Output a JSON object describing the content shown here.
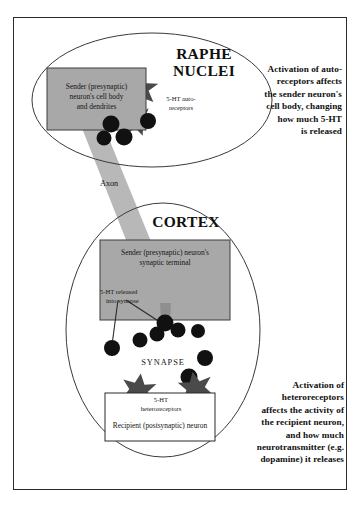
{
  "figure": {
    "regions": {
      "raphe": {
        "name": "RAPHE NUCLEI",
        "line1": "RAPHE",
        "line2": "NUCLEI",
        "sender_box_line1": "Sender (presynaptic)",
        "sender_box_line2": "neuron's cell body",
        "sender_box_line3": "and dendrites",
        "autoreceptor_line1": "5-HT auto-",
        "autoreceptor_line2": "receptors"
      },
      "axon": {
        "label": "Axon"
      },
      "cortex": {
        "name": "CORTEX",
        "terminal_line1": "Sender (presynaptic) neuron's",
        "terminal_line2": "synaptic terminal",
        "release_line1": "5-HT released",
        "release_line2": "into synapse",
        "synapse_label": "SYNAPSE",
        "heteroreceptor_line1": "5-HT",
        "heteroreceptor_line2": "heteroreceptors",
        "recipient_label": "Recipient (postsynaptic) neuron"
      }
    },
    "annotations": {
      "top_right": {
        "lines": [
          "Activation of auto-",
          "receptors affects",
          "the sender neuron's",
          "cell body, changing",
          "how much 5-HT",
          "is released"
        ]
      },
      "bottom_right": {
        "lines": [
          "Activation of",
          "heteroreceptors",
          "affects the activity of",
          "the recipient neuron,",
          "and how much",
          "neurotransmitter (e.g.",
          "dopamine) it releases"
        ]
      }
    },
    "colors": {
      "frame_stroke": "#2b2b2b",
      "oval_stroke": "#3a3a3a",
      "cell_fill": "#a8a8a8",
      "cell_stroke": "#3c3c3c",
      "axon_fill": "#b8b8b8",
      "receptor_fill": "#4a4a4a",
      "molecule_fill": "#111111",
      "background": "#ffffff",
      "text": "#101010"
    },
    "shapes": {
      "raphe_oval": {
        "cx": 152,
        "cy": 100,
        "rx": 120,
        "ry": 67
      },
      "cortex_oval": {
        "cx": 163,
        "cy": 330,
        "rx": 97,
        "ry": 127
      },
      "sender_cell_box": {
        "x": 47,
        "y": 68,
        "w": 99,
        "h": 62
      },
      "terminal_box": {
        "x": 100,
        "y": 240,
        "w": 130,
        "h": 80
      },
      "recipient_box": {
        "x": 105,
        "y": 393,
        "w": 110,
        "h": 48
      },
      "autoreceptors": [
        {
          "cx": 140,
          "cy": 88,
          "r": 18,
          "rot": 12
        },
        {
          "cx": 137,
          "cy": 120,
          "r": 15,
          "rot": -20
        }
      ],
      "heteroreceptors": [
        {
          "cx": 139,
          "cy": 389,
          "r": 17,
          "rot": 8
        },
        {
          "cx": 196,
          "cy": 387,
          "r": 17,
          "rot": -10
        }
      ],
      "molecules_raphe": [
        {
          "cx": 111,
          "cy": 124,
          "r": 8
        },
        {
          "cx": 123,
          "cy": 136,
          "r": 8
        },
        {
          "cx": 104,
          "cy": 137,
          "r": 7
        },
        {
          "cx": 148,
          "cy": 122,
          "r": 8
        }
      ],
      "molecules_synapse": [
        {
          "cx": 165,
          "cy": 324,
          "r": 8
        },
        {
          "cx": 177,
          "cy": 330,
          "r": 7
        },
        {
          "cx": 157,
          "cy": 334,
          "r": 7
        },
        {
          "cx": 197,
          "cy": 331,
          "r": 7
        },
        {
          "cx": 140,
          "cy": 340,
          "r": 7
        },
        {
          "cx": 112,
          "cy": 348,
          "r": 8
        },
        {
          "cx": 204,
          "cy": 358,
          "r": 8
        },
        {
          "cx": 188,
          "cy": 378,
          "r": 8
        }
      ]
    }
  }
}
